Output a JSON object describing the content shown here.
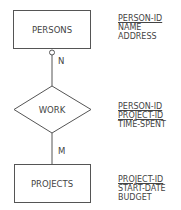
{
  "diagram": {
    "type": "entity-relationship",
    "entities": [
      {
        "name": "PERSONS",
        "attributes": [
          {
            "label": "PERSON-ID",
            "key": true
          },
          {
            "label": "NAME",
            "key": false
          },
          {
            "label": "ADDRESS",
            "key": false
          }
        ]
      },
      {
        "name": "PROJECTS",
        "attributes": [
          {
            "label": "PROJECT-ID",
            "key": true
          },
          {
            "label": "START-DATE",
            "key": false
          },
          {
            "label": "BUDGET",
            "key": false
          }
        ]
      }
    ],
    "relationships": [
      {
        "name": "WORK",
        "attributes": [
          {
            "label": "PERSON-ID",
            "key": true
          },
          {
            "label": "PROJECT-ID",
            "key": true
          },
          {
            "label": "TIME-SPENT",
            "key": false
          }
        ]
      }
    ],
    "cardinalities": {
      "persons_work": "N",
      "work_projects": "M"
    }
  }
}
